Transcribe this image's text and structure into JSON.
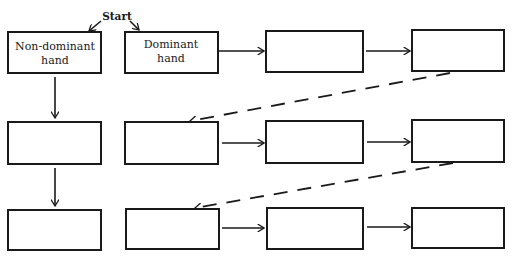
{
  "start_label": "Start",
  "boxes": [
    {
      "id": "r1c1",
      "lines": [
        "Non-dominant",
        "hand"
      ]
    },
    {
      "id": "r1c2",
      "lines": [
        "Dominant",
        "hand"
      ]
    },
    {
      "id": "r1c3",
      "lines": []
    },
    {
      "id": "r1c4",
      "lines": []
    },
    {
      "id": "r2c1",
      "lines": []
    },
    {
      "id": "r2c2",
      "lines": []
    },
    {
      "id": "r2c3",
      "lines": []
    },
    {
      "id": "r2c4",
      "lines": []
    },
    {
      "id": "r3c1",
      "lines": []
    },
    {
      "id": "r3c2",
      "lines": []
    },
    {
      "id": "r3c3",
      "lines": []
    },
    {
      "id": "r3c4",
      "lines": []
    }
  ]
}
